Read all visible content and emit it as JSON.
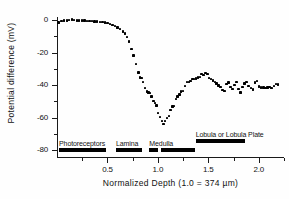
{
  "chart_data": {
    "type": "scatter",
    "title": "",
    "xlabel": "Normalized  Depth    (1.0 = 374 µm)",
    "ylabel": "Potential  difference  (mV)",
    "xlim": [
      0.0,
      2.25
    ],
    "ylim": [
      -87,
      5
    ],
    "grid": false,
    "legend": "none",
    "x_ticks_major": [
      0.5,
      1.0,
      1.5,
      2.0
    ],
    "x_tick_labels": [
      "0.5",
      "1.0",
      "1.5",
      "2.0"
    ],
    "x_ticks_minor": [
      0.25,
      0.75,
      1.25,
      1.75,
      2.25
    ],
    "y_ticks_major": [
      0,
      -20,
      -40,
      -60,
      -80
    ],
    "y_tick_labels": [
      "0",
      "-20",
      "-40",
      "-60",
      "-80"
    ],
    "y_ticks_minor": [
      -10,
      -30,
      -50,
      -70
    ],
    "series": [
      {
        "name": "Potential difference vs normalized depth",
        "marker": "filled-square",
        "color": "#000000",
        "points": [
          [
            0.015,
            -1.6
          ],
          [
            0.045,
            -0.8
          ],
          [
            0.072,
            -0.4
          ],
          [
            0.098,
            -0.2
          ],
          [
            0.122,
            0.0
          ],
          [
            0.147,
            0.2
          ],
          [
            0.171,
            0.0
          ],
          [
            0.196,
            -0.2
          ],
          [
            0.221,
            -0.2
          ],
          [
            0.247,
            -0.4
          ],
          [
            0.272,
            -0.4
          ],
          [
            0.297,
            -0.6
          ],
          [
            0.323,
            -0.6
          ],
          [
            0.348,
            -0.8
          ],
          [
            0.373,
            -1.0
          ],
          [
            0.399,
            -1.0
          ],
          [
            0.424,
            -1.2
          ],
          [
            0.45,
            -1.4
          ],
          [
            0.475,
            -1.6
          ],
          [
            0.5,
            -2.0
          ],
          [
            0.526,
            -2.4
          ],
          [
            0.551,
            -3.0
          ],
          [
            0.576,
            -3.6
          ],
          [
            0.601,
            -4.6
          ],
          [
            0.627,
            -5.6
          ],
          [
            0.652,
            -7.0
          ],
          [
            0.672,
            -8.4
          ],
          [
            0.692,
            -10.6
          ],
          [
            0.716,
            -13.2
          ],
          [
            0.74,
            -17.8
          ],
          [
            0.76,
            -21.8
          ],
          [
            0.783,
            -27.0
          ],
          [
            0.806,
            -32.4
          ],
          [
            0.822,
            -35.4
          ],
          [
            0.838,
            -35.6
          ],
          [
            0.855,
            -38.0
          ],
          [
            0.872,
            -41.8
          ],
          [
            0.89,
            -44.0
          ],
          [
            0.906,
            -44.6
          ],
          [
            0.922,
            -45.0
          ],
          [
            0.938,
            -47.0
          ],
          [
            0.955,
            -49.8
          ],
          [
            0.972,
            -51.0
          ],
          [
            0.988,
            -52.6
          ],
          [
            1.004,
            -57.2
          ],
          [
            1.02,
            -59.6
          ],
          [
            1.038,
            -62.0
          ],
          [
            1.056,
            -64.0
          ],
          [
            1.073,
            -62.0
          ],
          [
            1.09,
            -60.2
          ],
          [
            1.108,
            -59.0
          ],
          [
            1.126,
            -55.2
          ],
          [
            1.143,
            -53.2
          ],
          [
            1.16,
            -52.8
          ],
          [
            1.178,
            -48.6
          ],
          [
            1.196,
            -47.0
          ],
          [
            1.214,
            -45.8
          ],
          [
            1.232,
            -44.0
          ],
          [
            1.25,
            -43.6
          ],
          [
            1.27,
            -40.6
          ],
          [
            1.288,
            -38.0
          ],
          [
            1.306,
            -38.2
          ],
          [
            1.324,
            -37.6
          ],
          [
            1.342,
            -36.2
          ],
          [
            1.36,
            -36.2
          ],
          [
            1.378,
            -36.0
          ],
          [
            1.398,
            -35.4
          ],
          [
            1.416,
            -35.0
          ],
          [
            1.434,
            -33.4
          ],
          [
            1.452,
            -33.8
          ],
          [
            1.472,
            -32.6
          ],
          [
            1.49,
            -33.4
          ],
          [
            1.508,
            -35.6
          ],
          [
            1.526,
            -36.4
          ],
          [
            1.546,
            -37.2
          ],
          [
            1.564,
            -38.2
          ],
          [
            1.582,
            -39.0
          ],
          [
            1.602,
            -40.4
          ],
          [
            1.62,
            -41.4
          ],
          [
            1.64,
            -43.0
          ],
          [
            1.66,
            -43.6
          ],
          [
            1.682,
            -39.4
          ],
          [
            1.7,
            -38.4
          ],
          [
            1.72,
            -41.2
          ],
          [
            1.74,
            -42.6
          ],
          [
            1.76,
            -40.0
          ],
          [
            1.78,
            -38.2
          ],
          [
            1.8,
            -42.4
          ],
          [
            1.82,
            -44.6
          ],
          [
            1.84,
            -41.2
          ],
          [
            1.86,
            -39.0
          ],
          [
            1.88,
            -38.2
          ],
          [
            1.9,
            -40.6
          ],
          [
            1.92,
            -41.8
          ],
          [
            1.94,
            -42.8
          ],
          [
            1.962,
            -38.4
          ],
          [
            1.982,
            -37.4
          ],
          [
            2.002,
            -41.0
          ],
          [
            2.024,
            -41.6
          ],
          [
            2.046,
            -41.6
          ],
          [
            2.066,
            -41.8
          ],
          [
            2.086,
            -41.6
          ],
          [
            2.106,
            -41.4
          ],
          [
            2.126,
            -41.8
          ],
          [
            2.148,
            -40.6
          ],
          [
            2.168,
            -39.2
          ],
          [
            2.188,
            -39.6
          ]
        ]
      }
    ],
    "annotations": [
      {
        "label": "Photoreceptors",
        "x_start": 0.02,
        "x_end": 0.49,
        "y_level": -79
      },
      {
        "label": "Lamina",
        "x_start": 0.585,
        "x_end": 0.84,
        "y_level": -79
      },
      {
        "label": "Medulla",
        "x_start": 0.915,
        "x_end": 1.0,
        "y_level": -79
      },
      {
        "label": "",
        "x_start": 1.03,
        "x_end": 1.37,
        "y_level": -79
      },
      {
        "label": "Lobula  or  Lobula  Plate",
        "x_start": 1.375,
        "x_end": 1.86,
        "y_level": -73
      }
    ]
  }
}
